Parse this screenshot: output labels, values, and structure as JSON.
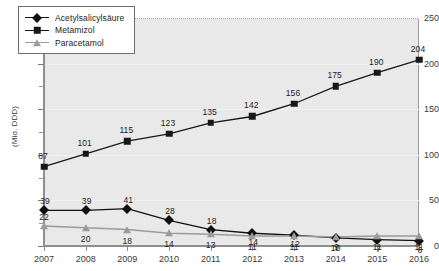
{
  "chart_data": {
    "type": "line",
    "title": "",
    "xlabel": "",
    "ylabel": "(Mio. DDD)",
    "categories": [
      "2007",
      "2008",
      "2009",
      "2010",
      "2011",
      "2012",
      "2013",
      "2014",
      "2015",
      "2016"
    ],
    "x": [
      2007,
      2008,
      2009,
      2010,
      2011,
      2012,
      2013,
      2014,
      2015,
      2016
    ],
    "ylim": [
      0,
      250
    ],
    "yticks": [
      0,
      50,
      100,
      150,
      200,
      250
    ],
    "ytick_labels": [
      "0",
      "50",
      "100",
      "150",
      "200",
      "250"
    ],
    "grid": true,
    "legend_position": "top-left",
    "series": [
      {
        "name": "Acetylsalicylsäure",
        "marker": "diamond",
        "color": "#111111",
        "values": [
          39,
          39,
          41,
          28,
          18,
          14,
          12,
          9,
          7,
          6
        ],
        "labels": [
          "39",
          "39",
          "41",
          "28",
          "18",
          "14",
          "12",
          "9",
          "7",
          "6"
        ]
      },
      {
        "name": "Metamizol",
        "marker": "square",
        "color": "#181818",
        "values": [
          87,
          101,
          115,
          123,
          135,
          142,
          156,
          175,
          190,
          204
        ],
        "labels": [
          "87",
          "101",
          "115",
          "123",
          "135",
          "142",
          "156",
          "175",
          "190",
          "204"
        ]
      },
      {
        "name": "Paracetamol",
        "marker": "triangle",
        "color": "#9b9b9b",
        "values": [
          22,
          20,
          18,
          14,
          13,
          11,
          11,
          10,
          11,
          11
        ],
        "labels": [
          "22",
          "20",
          "18",
          "14",
          "13",
          "11",
          "11",
          "10",
          "11",
          "11"
        ]
      }
    ]
  },
  "legend": {
    "items": [
      {
        "label": "Acetylsalicylsäure"
      },
      {
        "label": "Metamizol"
      },
      {
        "label": "Paracetamol"
      }
    ]
  },
  "axis": {
    "y_title": "(Mio. DDD)"
  },
  "colors": {
    "plot_background": "#e9e9e9",
    "gridline": "#fbfbfb",
    "axis": "#8e8e8e",
    "series_dark": "#111111",
    "series_gray": "#9b9b9b",
    "text": "#1c1c1c"
  }
}
